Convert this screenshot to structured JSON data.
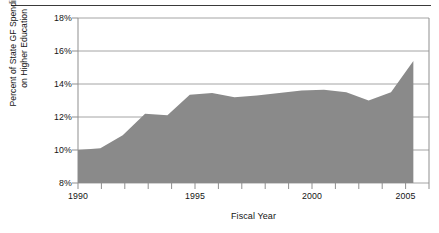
{
  "chart_data": {
    "type": "area",
    "title": "",
    "xlabel": "Fiscal Year",
    "ylabel": "Percent of State GF Spending on Higher Education",
    "ylabel_line1": "Percent of State GF Spending",
    "ylabel_line2": "on Higher Education",
    "x": [
      1990,
      1991,
      1992,
      1993,
      1994,
      1995,
      1996,
      1997,
      1998,
      1999,
      2000,
      2001,
      2002,
      2003,
      2004,
      2005
    ],
    "values": [
      10.0,
      10.1,
      10.9,
      12.2,
      12.1,
      13.35,
      13.45,
      13.2,
      13.3,
      13.45,
      13.6,
      13.65,
      13.5,
      13.0,
      13.5,
      15.4
    ],
    "categories": [
      "1990",
      "1991",
      "1992",
      "1993",
      "1994",
      "1995",
      "1996",
      "1997",
      "1998",
      "1999",
      "2000",
      "2001",
      "2002",
      "2003",
      "2004",
      "2005"
    ],
    "xlim": [
      1990,
      2005.7
    ],
    "ylim": [
      8,
      18
    ],
    "ytick_labels": [
      "8%",
      "10%",
      "12%",
      "14%",
      "16%",
      "18%"
    ],
    "ytick_values": [
      8,
      10,
      12,
      14,
      16,
      18
    ],
    "xtick_labels": [
      "1990",
      "1995",
      "2000",
      "2005"
    ],
    "xtick_values": [
      1990,
      1995,
      2000,
      2005
    ],
    "grid": "horizontal",
    "legend": "none",
    "series_fill_color": "#8a8a8a",
    "axis_color": "#808080",
    "rule_color": "#3a3a3a"
  }
}
